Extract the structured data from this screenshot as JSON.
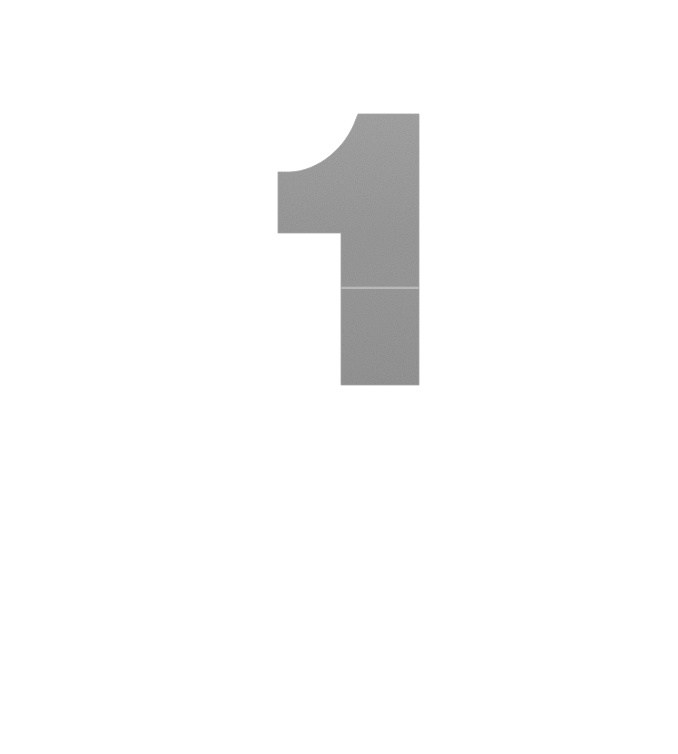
{
  "page": {
    "background_color": "#ffffff",
    "width": 678,
    "height": 754,
    "caption": "",
    "folio": ""
  },
  "glyph": {
    "character": "1",
    "name": "numeral-one",
    "style": "bold geometric sans-serif",
    "fill_color": "#9a9a9a",
    "fill_color_light": "#a4a4a4",
    "fill_color_dark": "#949494",
    "seam_color": "#c9c9c9",
    "texture": "mottled halftone grain",
    "bounds": {
      "left": 278,
      "top": 114,
      "right": 419,
      "bottom": 385,
      "width": 141,
      "height": 271
    },
    "stem": {
      "left": 341,
      "right": 419,
      "top": 114,
      "bottom": 385,
      "width": 78
    },
    "flag": {
      "left": 278,
      "right": 341,
      "top": 172,
      "bottom": 233,
      "height": 61
    },
    "curve": {
      "start_x": 358,
      "start_y": 114,
      "end_x": 290,
      "end_y": 172,
      "type": "concave-arc"
    },
    "seam_artifact": {
      "y": 288,
      "visible": true
    }
  }
}
